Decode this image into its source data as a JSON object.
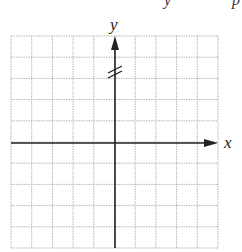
{
  "diagram": {
    "type": "coordinate-plane",
    "grid": {
      "columns": 10,
      "rows": 10,
      "left": 11,
      "top": 36,
      "right": 218,
      "bottom": 248,
      "line_color": "#b5b5b5",
      "line_style": "dotted"
    },
    "axes": {
      "x": {
        "label": "x",
        "y_position": 143,
        "arrow": "right",
        "color": "#222222"
      },
      "y": {
        "label": "y",
        "x_position": 115,
        "arrow": "up",
        "color": "#222222",
        "break_mark": {
          "y": 70,
          "symbol": "//"
        }
      }
    },
    "top_cut_text": [
      "y",
      "p"
    ]
  }
}
